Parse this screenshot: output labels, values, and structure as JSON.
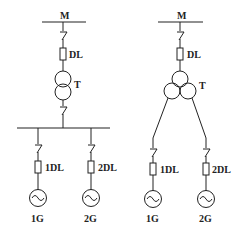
{
  "diagram": {
    "type": "single-line electrical diagram",
    "left": {
      "bus_label": "M",
      "breaker_label": "DL",
      "transformer_label": "T",
      "transformer_type": "two-winding",
      "branches": [
        {
          "breaker_label": "1DL",
          "generator_label": "1G"
        },
        {
          "breaker_label": "2DL",
          "generator_label": "2G"
        }
      ]
    },
    "right": {
      "bus_label": "M",
      "breaker_label": "DL",
      "transformer_label": "T",
      "transformer_type": "three-winding",
      "branches": [
        {
          "breaker_label": "1DL",
          "generator_label": "1G"
        },
        {
          "breaker_label": "2DL",
          "generator_label": "2G"
        }
      ]
    }
  },
  "colors": {
    "line": "#222222",
    "background": "#ffffff"
  }
}
